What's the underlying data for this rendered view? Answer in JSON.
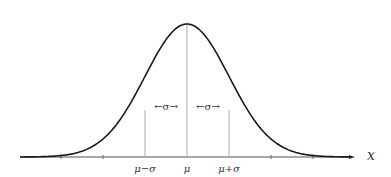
{
  "chart_data": {
    "type": "line",
    "title": "",
    "xlabel": "x",
    "ylabel": "",
    "x_tick_labels": [
      "μ−σ",
      "μ",
      "μ+σ"
    ],
    "x_ticks_sigma": [
      -3,
      -2,
      -1,
      0,
      1,
      2,
      3
    ],
    "annotations": [
      "←σ→",
      "←σ→"
    ],
    "series": [
      {
        "name": "normal pdf",
        "x_sigma": [
          -4,
          -3,
          -2,
          -1.5,
          -1,
          -0.5,
          0,
          0.5,
          1,
          1.5,
          2,
          3,
          4
        ],
        "values": [
          0.0001,
          0.0044,
          0.054,
          0.1295,
          0.242,
          0.352,
          0.399,
          0.352,
          0.242,
          0.1295,
          0.054,
          0.0044,
          0.0001
        ]
      }
    ],
    "grid": false,
    "legend": "none"
  },
  "labels": {
    "x_axis": "x",
    "mu_minus_sigma": "μ−σ",
    "mu": "μ",
    "mu_plus_sigma": "μ+σ",
    "sigma_left": "←σ→",
    "sigma_right": "←σ→"
  },
  "colors": {
    "curve": "#1a1a1a",
    "axis": "#555555",
    "guides": "#aaaaaa"
  }
}
